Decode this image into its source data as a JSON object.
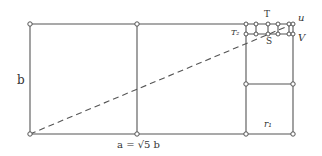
{
  "diagram": {
    "type": "geometric construction (root rectangle subdivision)",
    "colors": {
      "line": "#555555",
      "node_fill": "#ffffff",
      "background": "#ffffff"
    },
    "labels": {
      "side_b": "b",
      "base_a": "a = √5 b",
      "point_T": "T",
      "point_U": "u",
      "point_T2": "T₂",
      "point_S": "S",
      "point_V": "V",
      "region_r1": "r₁"
    }
  }
}
